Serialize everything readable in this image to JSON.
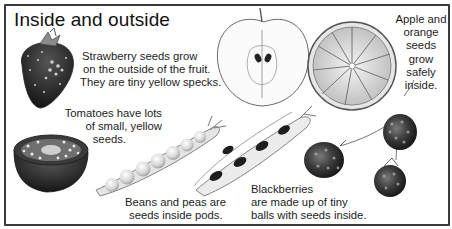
{
  "title": "Inside and outside",
  "captions": {
    "strawberry": [
      "Strawberry seeds grow",
      "on the outside of the fruit.",
      "They are tiny yellow specks."
    ],
    "apple_orange": [
      "Apple and",
      "orange",
      "seeds",
      "grow",
      "safely",
      "inside."
    ],
    "tomato": [
      "Tomatoes have lots",
      "of small, yellow",
      "seeds."
    ],
    "beans_peas": [
      "Beans and peas are",
      "seeds inside pods."
    ],
    "blackberries": [
      "Blackberries",
      "are made up of tiny",
      "balls with seeds inside."
    ]
  },
  "illustrations": [
    "strawberry",
    "apple-half",
    "orange-slice",
    "tomato-half",
    "pea-pod",
    "bean-pod",
    "blackberries"
  ],
  "colors": {
    "border": "#3a3a3a",
    "text": "#1a1a1a",
    "background": "#ffffff"
  }
}
